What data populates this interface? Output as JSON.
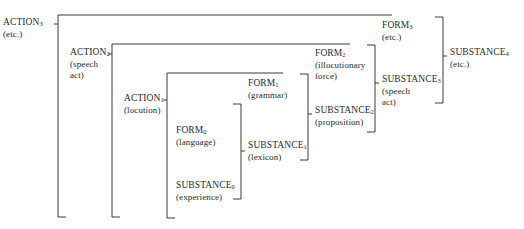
{
  "diagram": {
    "type": "nested-bracket hierarchy",
    "nodes": {
      "action3": {
        "term": "ACTION",
        "index": "3",
        "gloss": [
          "(etc.)"
        ]
      },
      "action2": {
        "term": "ACTION",
        "index": "2",
        "gloss": [
          "(speech",
          "act)"
        ]
      },
      "action1": {
        "term": "ACTION",
        "index": "1",
        "gloss": [
          "(locution)"
        ]
      },
      "form0": {
        "term": "FORM",
        "index": "0",
        "gloss": [
          "(language)"
        ]
      },
      "substance0": {
        "term": "SUBSTANCE",
        "index": "0",
        "gloss": [
          "(experience)"
        ]
      },
      "substance1": {
        "term": "SUBSTANCE",
        "index": "1",
        "gloss": [
          "(lexicon)"
        ]
      },
      "form1": {
        "term": "FORM",
        "index": "1",
        "gloss": [
          "(grammar)"
        ]
      },
      "substance2": {
        "term": "SUBSTANCE",
        "index": "2",
        "gloss": [
          "(proposition)"
        ]
      },
      "form2": {
        "term": "FORM",
        "index": "2",
        "gloss": [
          "(illocutionary",
          "force)"
        ]
      },
      "substance3": {
        "term": "SUBSTANCE",
        "index": "3",
        "gloss": [
          "(speech",
          "act)"
        ]
      },
      "form3": {
        "term": "FORM",
        "index": "3",
        "gloss": [
          "(etc.)"
        ]
      },
      "substance4": {
        "term": "SUBSTANCE",
        "index": "4",
        "gloss": [
          "(etc.)"
        ]
      }
    },
    "relations": [
      {
        "bracket": "action1",
        "contains": [
          "form0",
          "substance0"
        ]
      },
      {
        "bracket": "substance1",
        "contains": [
          "form0",
          "substance0"
        ]
      },
      {
        "bracket": "substance2",
        "contains": [
          "form1",
          "substance1"
        ]
      },
      {
        "bracket": "substance3",
        "contains": [
          "form2",
          "substance2"
        ]
      },
      {
        "bracket": "substance4",
        "contains": [
          "form3",
          "substance3"
        ]
      },
      {
        "bracket": "action2",
        "contains": [
          "action1",
          "form1",
          "form2"
        ]
      },
      {
        "bracket": "action3",
        "contains": [
          "action2",
          "form3"
        ]
      }
    ]
  }
}
